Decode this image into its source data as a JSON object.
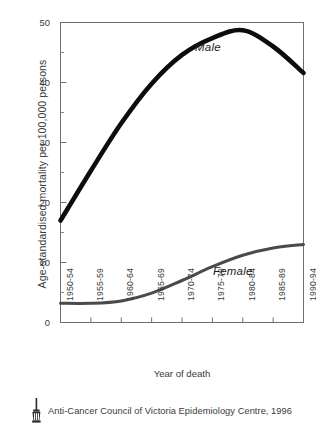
{
  "chart_data": {
    "type": "line",
    "title": "",
    "xlabel": "Year of death",
    "ylabel": "Age-standardised mortality per 100,000 persons",
    "categories": [
      "1950-54",
      "1955-59",
      "1960-64",
      "1965-69",
      "1970-74",
      "1975-79",
      "1980-84",
      "1985-89",
      "1990-94"
    ],
    "xlim": [
      0,
      8
    ],
    "ylim": [
      0,
      50
    ],
    "yticks": [
      0,
      10,
      20,
      30,
      40,
      50
    ],
    "yticklabels": [
      "0",
      "10",
      "20",
      "30",
      "40",
      "50"
    ],
    "yminorticks": [
      5,
      15,
      25,
      35,
      45
    ],
    "grid": false,
    "legend": "inline-annotations",
    "series": [
      {
        "name": "Male",
        "color": "#0d0d0d",
        "linewidth": 4.6,
        "values": [
          17.0,
          25.3,
          33.2,
          39.8,
          44.6,
          47.4,
          48.7,
          46.0,
          41.6
        ]
      },
      {
        "name": "Female",
        "color": "#4a4a4a",
        "linewidth": 3.0,
        "values": [
          3.2,
          3.2,
          3.6,
          4.9,
          7.0,
          9.3,
          11.2,
          12.4,
          13.0
        ]
      }
    ],
    "annotations": [
      {
        "text": "Male",
        "x": 5.1,
        "y": 46.0
      },
      {
        "text": "Female",
        "x": 6.0,
        "y": 9.6
      }
    ]
  },
  "credit": {
    "text": "Anti-Cancer Council of Victoria Epidemiology Centre, 1996",
    "logo_name": "anti-cancer-council-torch-logo"
  }
}
